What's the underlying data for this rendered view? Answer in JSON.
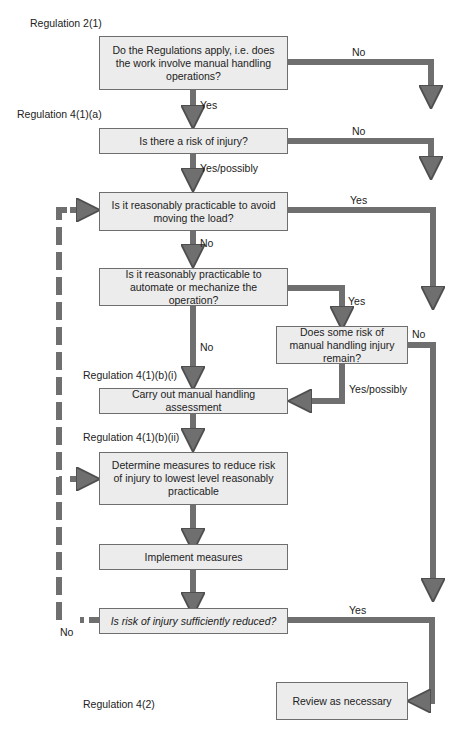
{
  "regulations": {
    "r2_1": "Regulation 2(1)",
    "r4_1_a": "Regulation 4(1)(a)",
    "r4_1_b_i": "Regulation 4(1)(b)(i)",
    "r4_1_b_ii": "Regulation 4(1)(b)(ii)",
    "r4_2": "Regulation 4(2)"
  },
  "boxes": {
    "apply": "Do the Regulations apply, i.e. does the work involve manual handling operations?",
    "risk": "Is there a risk of injury?",
    "avoid": "Is it reasonably practicable to avoid moving the load?",
    "automate": "Is it reasonably practicable to automate or mechanize the operation?",
    "remain": "Does some risk of manual handling injury remain?",
    "assessment": "Carry out manual handling assessment",
    "determine": "Determine measures to reduce risk of injury to lowest level reasonably practicable",
    "implement": "Implement measures",
    "reduced": "Is risk of injury sufficiently reduced?",
    "review": "Review as necessary"
  },
  "edges": {
    "apply_no": "No",
    "apply_yes": "Yes",
    "risk_no": "No",
    "risk_yes": "Yes/possibly",
    "avoid_yes": "Yes",
    "avoid_no": "No",
    "automate_yes": "Yes",
    "automate_no": "No",
    "remain_no": "No",
    "remain_yes": "Yes/possibly",
    "reduced_yes": "Yes",
    "reduced_no": "No"
  },
  "colors": {
    "box_fill": "#ececec",
    "box_border": "#6e6e6e",
    "arrow": "#6f6f6f"
  }
}
